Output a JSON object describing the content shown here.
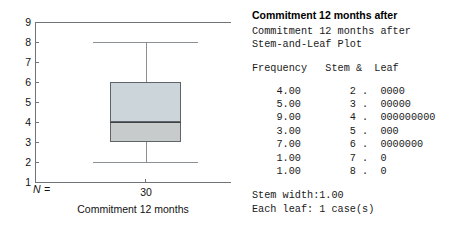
{
  "chart_data": {
    "type": "boxplot",
    "title": "",
    "xlabel": "Commitment 12 months",
    "ylabel": "",
    "ylim": [
      1,
      9
    ],
    "yticks": [
      9,
      8,
      7,
      6,
      5,
      4,
      3,
      2,
      1
    ],
    "grid": false,
    "n_label": "N =",
    "categories": [
      "Commitment 12 months"
    ],
    "n_values": [
      "30"
    ],
    "boxes": [
      {
        "category": "Commitment 12 months",
        "n": 30,
        "min_whisker": 2,
        "q1": 3,
        "median": 4,
        "q3": 6,
        "max_whisker": 8,
        "outliers": []
      }
    ],
    "colors": {
      "box_upper_fill": "#ccd5d9",
      "box_lower_fill": "#c8cbcb",
      "box_border": "#5e6468",
      "median_line": "#3d4346",
      "whisker": "#8a9094",
      "axis": "#6e7478",
      "background": "#ffffff"
    }
  },
  "stem_leaf": {
    "bold_title": "Commitment 12 months after",
    "subtitle_line1": "Commitment 12 months after",
    "subtitle_line2": "Stem-and-Leaf Plot",
    "header": "Frequency   Stem &  Leaf",
    "rows": [
      {
        "frequency": "4.00",
        "stem": "2",
        "sep": ".",
        "leaf": "0000",
        "line": "    4.00        2 .  0000"
      },
      {
        "frequency": "5.00",
        "stem": "3",
        "sep": ".",
        "leaf": "00000",
        "line": "    5.00        3 .  00000"
      },
      {
        "frequency": "9.00",
        "stem": "4",
        "sep": ".",
        "leaf": "000000000",
        "line": "    9.00        4 .  000000000"
      },
      {
        "frequency": "3.00",
        "stem": "5",
        "sep": ".",
        "leaf": "000",
        "line": "    3.00        5 .  000"
      },
      {
        "frequency": "7.00",
        "stem": "6",
        "sep": ".",
        "leaf": "0000000",
        "line": "    7.00        6 .  0000000"
      },
      {
        "frequency": "1.00",
        "stem": "7",
        "sep": ".",
        "leaf": "0",
        "line": "    1.00        7 .  0"
      },
      {
        "frequency": "1.00",
        "stem": "8",
        "sep": ".",
        "leaf": "0",
        "line": "    1.00        8 .  0"
      }
    ],
    "footer_line1": "Stem width:1.00",
    "footer_line2": "Each leaf: 1 case(s)"
  }
}
